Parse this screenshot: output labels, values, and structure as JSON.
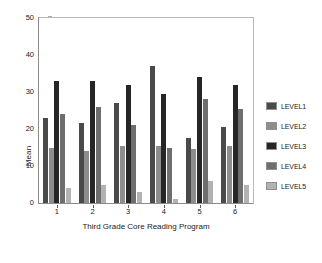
{
  "chart_data": {
    "type": "bar",
    "title": "",
    "subtitle": "",
    "xlabel": "Third Grade Core Reading Program",
    "ylabel": "Mean",
    "categories": [
      "1",
      "2",
      "3",
      "4",
      "5",
      "6"
    ],
    "ylim": [
      0,
      50
    ],
    "yticks": [
      0,
      10,
      20,
      30,
      40,
      50
    ],
    "grid": false,
    "legend_position": "right",
    "series": [
      {
        "name": "LEVEL1",
        "color": "#4a4a4a",
        "values": [
          23,
          21.5,
          27,
          37,
          17.5,
          20.5
        ]
      },
      {
        "name": "LEVEL2",
        "color": "#8d8d8d",
        "values": [
          15,
          14,
          15.5,
          15.5,
          14.5,
          15.5
        ]
      },
      {
        "name": "LEVEL3",
        "color": "#262626",
        "values": [
          33,
          33,
          32,
          29.5,
          34,
          32
        ]
      },
      {
        "name": "LEVEL4",
        "color": "#6e6e6e",
        "values": [
          24,
          26,
          21,
          15,
          28,
          25.5
        ]
      },
      {
        "name": "LEVEL5",
        "color": "#b2b2b2",
        "values": [
          4,
          5,
          3,
          1,
          6,
          5
        ]
      }
    ]
  },
  "axes": {
    "y_tick_labels": [
      "0",
      "10",
      "20",
      "30",
      "40",
      "50"
    ],
    "x_tick_labels": [
      "1",
      "2",
      "3",
      "4",
      "5",
      "6"
    ],
    "y_title": "Mean",
    "x_title": "Third Grade Core Reading Program"
  },
  "legend": {
    "items": [
      {
        "label": "LEVEL1",
        "color": "#4a4a4a"
      },
      {
        "label": "LEVEL2",
        "color": "#8d8d8d"
      },
      {
        "label": "LEVEL3",
        "color": "#262626"
      },
      {
        "label": "LEVEL4",
        "color": "#6e6e6e"
      },
      {
        "label": "LEVEL5",
        "color": "#b2b2b2"
      }
    ]
  },
  "colors": {
    "background": "#ffffff",
    "axis": "#8c8c8c",
    "frame_light": "#b9b9b9",
    "text": "#1a1a1a"
  }
}
